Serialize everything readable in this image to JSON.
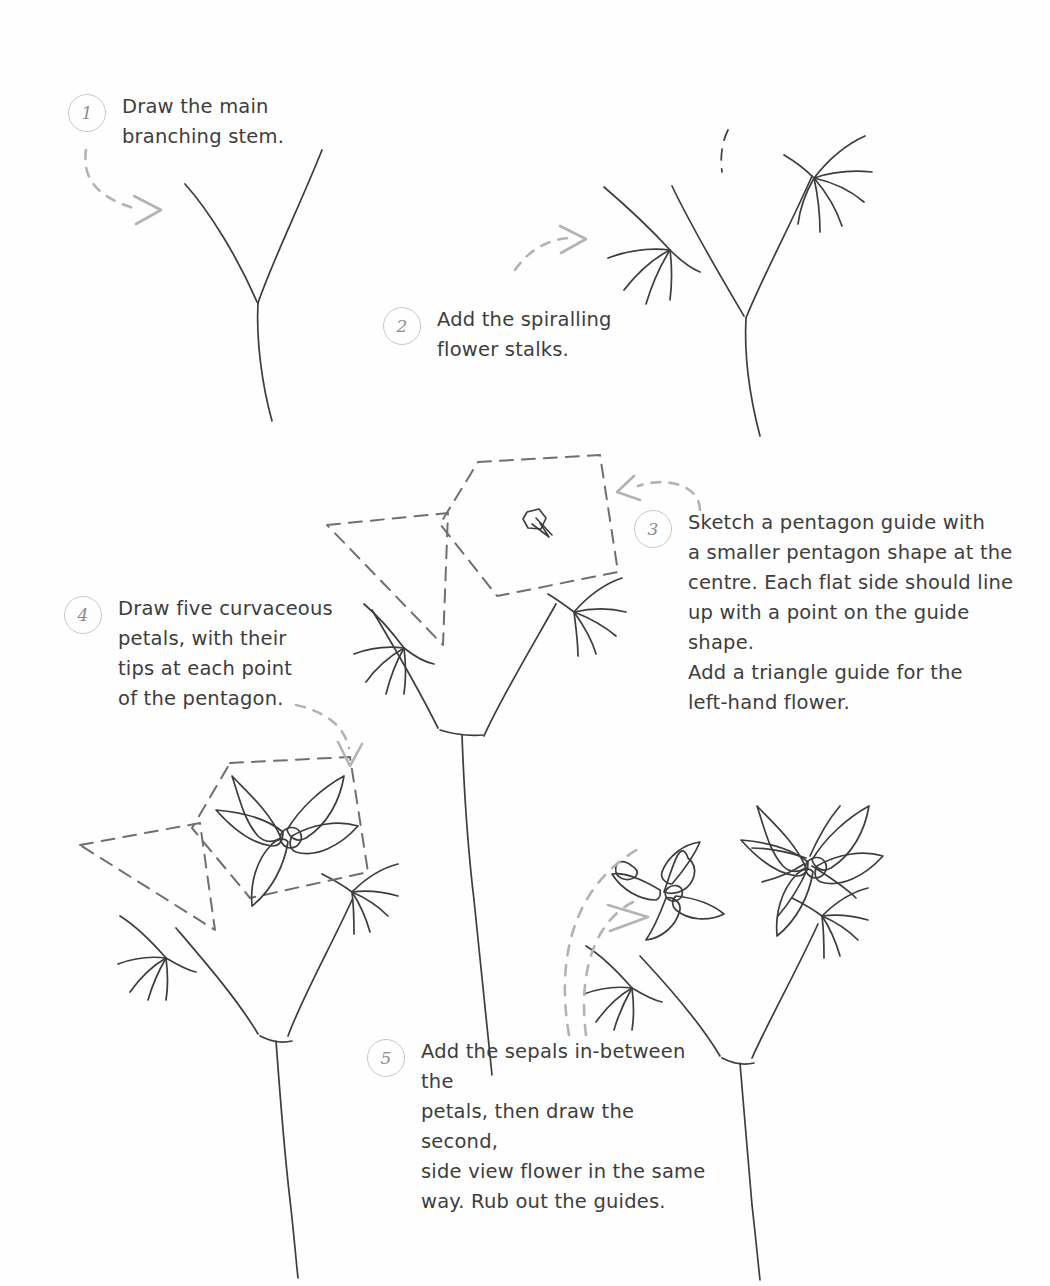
{
  "page": {
    "type": "hand-drawn step-by-step illustration",
    "background_color": "#fefefe",
    "ink_color": "#3d3d3d",
    "guide_color": "#6f6f6f",
    "arrow_color": "#b3b3b3",
    "circle_color": "#c9c9c9"
  },
  "steps": [
    {
      "number": "1",
      "text": "Draw the main\nbranching stem.",
      "illustration": "branching-y-stem"
    },
    {
      "number": "2",
      "text": "Add the spiralling\nflower stalks.",
      "illustration": "stem-with-spiral-stalks"
    },
    {
      "number": "3",
      "text": "Sketch a pentagon guide with\na smaller pentagon shape at the\ncentre. Each flat side should line\nup with a point on the guide shape.\nAdd a triangle guide for the\nleft-hand flower.",
      "illustration": "pentagon-and-triangle-guides"
    },
    {
      "number": "4",
      "text": "Draw five curvaceous\npetals, with their\ntips at each point\nof the pentagon.",
      "illustration": "five-petal-flower-in-guide"
    },
    {
      "number": "5",
      "text": "Add the sepals in-between the\npetals, then draw the second,\nside view flower in the same\nway. Rub out the guides.",
      "illustration": "finished-two-flowers"
    }
  ]
}
